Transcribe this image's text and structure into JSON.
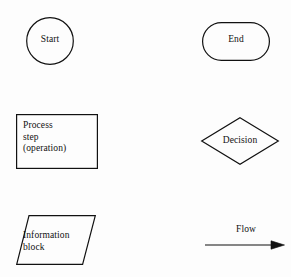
{
  "diagram": {
    "background_color": "#fdfdfd",
    "stroke_color": "#111111",
    "text_color": "#111111",
    "stroke_width": 1.2,
    "symbols": [
      {
        "id": "start",
        "shape": "circle",
        "label": "Start",
        "text_align": "center",
        "x": 26,
        "y": 17,
        "width": 48,
        "height": 48
      },
      {
        "id": "end",
        "shape": "stadium",
        "label": "End",
        "text_align": "center",
        "x": 202,
        "y": 22,
        "width": 68,
        "height": 39
      },
      {
        "id": "process",
        "shape": "rectangle",
        "label": "Process\nstep\n(operation)",
        "label_lines": [
          "Process",
          "step",
          "(operation)"
        ],
        "text_align": "left",
        "x": 16,
        "y": 114,
        "width": 82,
        "height": 55
      },
      {
        "id": "decision",
        "shape": "diamond",
        "label": "Decision",
        "text_align": "center",
        "x": 201,
        "y": 117,
        "width": 78,
        "height": 48
      },
      {
        "id": "information",
        "shape": "parallelogram",
        "label": "Information\nblock",
        "label_lines": [
          "Information",
          "block"
        ],
        "text_align": "left",
        "x": 16,
        "y": 215,
        "width": 78,
        "height": 50,
        "skew": 12
      },
      {
        "id": "flow",
        "shape": "arrow",
        "label": "Flow",
        "text_align": "center",
        "x": 205,
        "y": 240,
        "width": 80,
        "height": 8,
        "direction": "right"
      }
    ]
  }
}
